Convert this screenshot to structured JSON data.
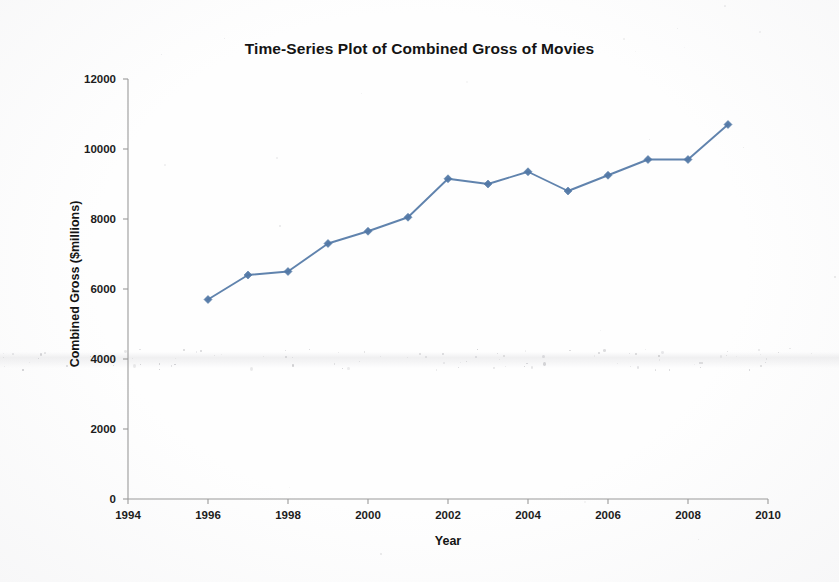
{
  "chart_data": {
    "type": "line",
    "title": "Time-Series Plot of Combined Gross of Movies",
    "xlabel": "Year",
    "ylabel": "Combined Gross ($millions)",
    "x": [
      1996,
      1997,
      1998,
      1999,
      2000,
      2001,
      2002,
      2003,
      2004,
      2005,
      2006,
      2007,
      2008,
      2009
    ],
    "values": [
      5700,
      6400,
      6500,
      7300,
      7650,
      8050,
      9150,
      9000,
      9350,
      8800,
      9250,
      9700,
      9700,
      10700
    ],
    "series": [
      {
        "name": "Combined Gross",
        "values": [
          5700,
          6400,
          6500,
          7300,
          7650,
          8050,
          9150,
          9000,
          9350,
          8800,
          9250,
          9700,
          9700,
          10700
        ]
      }
    ],
    "xlim": [
      1994,
      2010
    ],
    "ylim": [
      0,
      12000
    ],
    "xticks": [
      1994,
      1996,
      1998,
      2000,
      2002,
      2004,
      2006,
      2008,
      2010
    ],
    "xtick_labels": [
      "1994",
      "1996",
      "1998",
      "2000",
      "2002",
      "2004",
      "2006",
      "2008",
      "2010"
    ],
    "yticks": [
      0,
      2000,
      4000,
      6000,
      8000,
      10000,
      12000
    ],
    "ytick_labels": [
      "0",
      "2000",
      "4000",
      "6000",
      "8000",
      "10000",
      "12000"
    ],
    "grid": false,
    "legend": false,
    "marker": "diamond",
    "series_color": "#5278a6",
    "axis_color": "#9a9a9a",
    "background_color": "#fefefe"
  }
}
